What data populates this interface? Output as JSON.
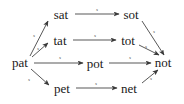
{
  "diagram": {
    "type": "directed-graph",
    "title": "",
    "stroke_color": "#3a3a3a",
    "text_color": "#1a1a1a",
    "background_color": "#ffffff",
    "nodes": [
      {
        "id": "pat",
        "label": "pat",
        "x": 20,
        "y": 62
      },
      {
        "id": "sat",
        "label": "sat",
        "x": 61,
        "y": 14
      },
      {
        "id": "tat",
        "label": "tat",
        "x": 60,
        "y": 40
      },
      {
        "id": "pot",
        "label": "pot",
        "x": 95,
        "y": 63
      },
      {
        "id": "pet",
        "label": "pet",
        "x": 62,
        "y": 88
      },
      {
        "id": "sot",
        "label": "sot",
        "x": 131,
        "y": 14
      },
      {
        "id": "tot",
        "label": "tot",
        "x": 128,
        "y": 40
      },
      {
        "id": "net",
        "label": "net",
        "x": 129,
        "y": 88
      },
      {
        "id": "not",
        "label": "not",
        "x": 163,
        "y": 62
      }
    ],
    "edges": [
      {
        "from": "pat",
        "to": "sat",
        "label": "s",
        "label_x": 34,
        "label_y": 35
      },
      {
        "from": "pat",
        "to": "tat",
        "label": "s",
        "label_x": 38,
        "label_y": 48
      },
      {
        "from": "pat",
        "to": "pot",
        "label": "s",
        "label_x": 60,
        "label_y": 57
      },
      {
        "from": "pat",
        "to": "pet",
        "label": "s",
        "label_x": 29,
        "label_y": 79
      },
      {
        "from": "sat",
        "to": "sot",
        "label": "s",
        "label_x": 97,
        "label_y": 9
      },
      {
        "from": "tat",
        "to": "tot",
        "label": "s",
        "label_x": 95,
        "label_y": 35
      },
      {
        "from": "pot",
        "to": "not",
        "label": "s",
        "label_x": 130,
        "label_y": 57
      },
      {
        "from": "pet",
        "to": "net",
        "label": "s",
        "label_x": 96,
        "label_y": 83
      },
      {
        "from": "sot",
        "to": "not",
        "label": "s",
        "label_x": 154,
        "label_y": 31
      },
      {
        "from": "tot",
        "to": "not",
        "label": "s",
        "label_x": 146,
        "label_y": 46
      },
      {
        "from": "net",
        "to": "not",
        "label": "s",
        "label_x": 151,
        "label_y": 78
      }
    ]
  }
}
